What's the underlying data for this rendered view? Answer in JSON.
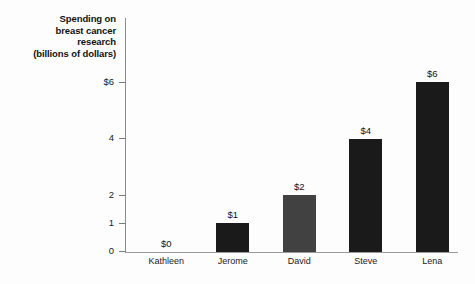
{
  "chart_data": {
    "type": "bar",
    "title": "",
    "ylabel": "Spending on breast cancer research (billions of dollars)",
    "ylabel_lines": [
      "Spending on",
      "breast cancer",
      "research",
      "(billions of dollars)"
    ],
    "xlabel": "",
    "categories": [
      "Kathleen",
      "Jerome",
      "David",
      "Steve",
      "Lena"
    ],
    "values": [
      0,
      1,
      2,
      4,
      6
    ],
    "value_labels": [
      "$0",
      "$1",
      "$2",
      "$4",
      "$6"
    ],
    "bar_colors": [
      "#1a1a1a",
      "#1a1a1a",
      "#414141",
      "#1a1a1a",
      "#1a1a1a"
    ],
    "ylim": [
      0,
      6.6
    ],
    "ytick_values": [
      0,
      1,
      2,
      4,
      6
    ],
    "ytick_labels": [
      "0",
      "1",
      "2",
      "4",
      "$6"
    ],
    "grid": false,
    "legend": null,
    "axis_color": "#8c8c8c",
    "background": "#fdfdfd"
  }
}
